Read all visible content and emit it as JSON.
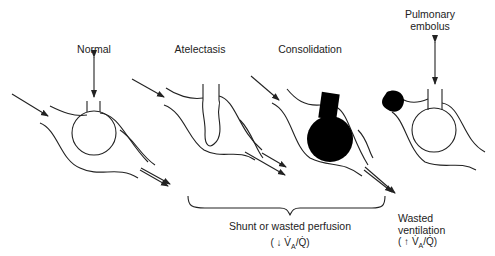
{
  "panels": [
    {
      "id": "normal",
      "label": "Normal"
    },
    {
      "id": "atelectasis",
      "label": "Atelectasis"
    },
    {
      "id": "consolidation",
      "label": "Consolidation"
    },
    {
      "id": "pulmonary-embolus",
      "label_line1": "Pulmonary",
      "label_line2": "embolus"
    }
  ],
  "groups": {
    "shunt": {
      "label": "Shunt or wasted perfusion",
      "ratio_prefix": "( ↓ ",
      "ratio_v": "V̇",
      "ratio_sub": "A",
      "ratio_q": "/Q̇)"
    },
    "wasted": {
      "label_line1": "Wasted",
      "label_line2": "ventilation",
      "ratio_prefix": "( ↑ ",
      "ratio_v": "V̇",
      "ratio_sub": "A",
      "ratio_q": "/Q̇)"
    }
  },
  "colors": {
    "line": "#222222",
    "fill": "#000000",
    "background": "#ffffff"
  }
}
